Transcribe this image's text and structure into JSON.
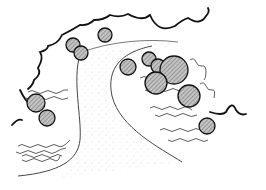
{
  "illustration": {
    "subject": "Hand-drawn garden plan sketch: curving path bordered by hedge line, hatched shrubs and groundcover",
    "colors": {
      "background": "#ffffff",
      "ink": "#1a1a1a",
      "shrub_fill": "#bdbdbd",
      "stipple": "#9a9a9a"
    },
    "elements": {
      "hedge_outline": "hedge",
      "path": "curving-path",
      "shrubs_count": 14,
      "groundcover_bands_count": 8
    }
  }
}
